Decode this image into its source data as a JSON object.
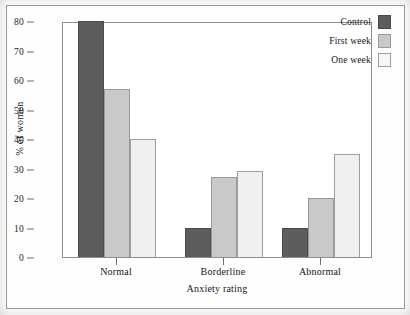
{
  "chart_data": {
    "type": "bar",
    "title": "",
    "subtitle": "",
    "xlabel": "Anxiety rating",
    "ylabel": "% of women",
    "categories": [
      "Normal",
      "Borderline",
      "Abnormal"
    ],
    "series": [
      {
        "name": "Control",
        "values": [
          80,
          10,
          10
        ],
        "color": "#5d5d5d"
      },
      {
        "name": "First week",
        "values": [
          57,
          27,
          20
        ],
        "color": "#c9c9c9"
      },
      {
        "name": "One week",
        "values": [
          40,
          29,
          35
        ],
        "color": "#f0f0f0"
      }
    ],
    "ylim": [
      0,
      80
    ],
    "ytick_values": [
      0,
      10,
      20,
      30,
      40,
      50,
      60,
      70,
      80
    ],
    "ytick_labels": [
      "0",
      "10",
      "20",
      "30",
      "40",
      "50",
      "60",
      "70",
      "80"
    ],
    "grid": false,
    "legend_position": "top-right",
    "bar_mode": "grouped",
    "axis_color": "#8d8d8d",
    "background_color": "#ffffff"
  },
  "legend": {
    "entries": [
      {
        "label": "Control"
      },
      {
        "label": "First week"
      },
      {
        "label": "One week"
      }
    ]
  }
}
